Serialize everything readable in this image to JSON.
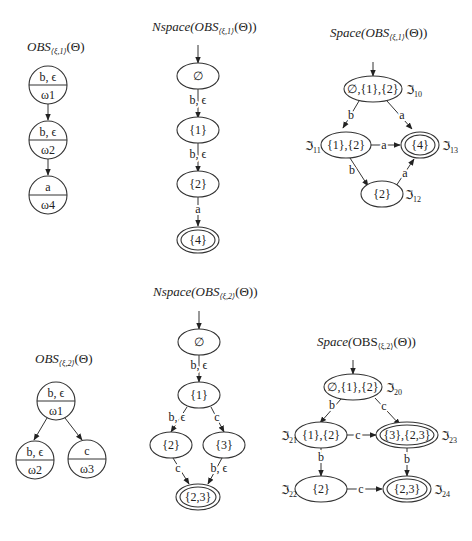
{
  "panels": [
    {
      "id": "obs1",
      "title": {
        "name": "OBS",
        "subscript": "⟨ξ,1⟩",
        "suffix": "(Θ)"
      },
      "nodes": [
        {
          "top": "b, ϵ",
          "bottom": "ω1"
        },
        {
          "top": "b, ϵ",
          "bottom": "ω2"
        },
        {
          "top": "a",
          "bottom": "ω4"
        }
      ]
    },
    {
      "id": "nspace1",
      "title": {
        "prefix": "Nspace(",
        "name": "OBS",
        "subscript": "⟨ξ,1⟩",
        "suffix": "(Θ))"
      },
      "nodes": [
        "∅",
        "{1}",
        "{2}",
        "{4}"
      ],
      "edges": [
        {
          "from": "∅",
          "to": "{1}",
          "label": "b, ϵ"
        },
        {
          "from": "{1}",
          "to": "{2}",
          "label": "b, ϵ"
        },
        {
          "from": "{2}",
          "to": "{4}",
          "label": "a"
        }
      ],
      "final": [
        "{4}"
      ]
    },
    {
      "id": "space1",
      "title": {
        "prefix": "Space(",
        "name": "OBS",
        "subscript": "⟨ξ,1⟩",
        "suffix": "(Θ))"
      },
      "nodes": [
        {
          "label": "∅,{1},{2}",
          "state": "ℑ",
          "sub": "10"
        },
        {
          "label": "{1},{2}",
          "state": "ℑ",
          "sub": "11"
        },
        {
          "label": "{4}",
          "state": "ℑ",
          "sub": "13"
        },
        {
          "label": "{2}",
          "state": "ℑ",
          "sub": "12"
        }
      ],
      "edges": [
        {
          "from": "∅,{1},{2}",
          "to": "{1},{2}",
          "label": "b"
        },
        {
          "from": "∅,{1},{2}",
          "to": "{4}",
          "label": "a"
        },
        {
          "from": "{1},{2}",
          "to": "{4}",
          "label": "a"
        },
        {
          "from": "{1},{2}",
          "to": "{2}",
          "label": "b"
        },
        {
          "from": "{2}",
          "to": "{4}",
          "label": "a"
        }
      ],
      "final": [
        "{4}"
      ]
    },
    {
      "id": "obs2",
      "title": {
        "name": "OBS",
        "subscript": "⟨ξ,2⟩",
        "suffix": "(Θ)"
      },
      "nodes": [
        {
          "top": "b, ϵ",
          "bottom": "ω1"
        },
        {
          "top": "b, ϵ",
          "bottom": "ω2"
        },
        {
          "top": "c",
          "bottom": "ω3"
        }
      ]
    },
    {
      "id": "nspace2",
      "title": {
        "prefix": "Nspace(",
        "name": "OBS",
        "subscript": "⟨ξ,2⟩",
        "suffix": "(Θ))"
      },
      "nodes": [
        "∅",
        "{1}",
        "{2}",
        "{3}",
        "{2,3}"
      ],
      "edges": [
        {
          "from": "∅",
          "to": "{1}",
          "label": "b, ϵ"
        },
        {
          "from": "{1}",
          "to": "{2}",
          "label": "b, ϵ"
        },
        {
          "from": "{1}",
          "to": "{3}",
          "label": "c"
        },
        {
          "from": "{2}",
          "to": "{2,3}",
          "label": "c"
        },
        {
          "from": "{3}",
          "to": "{2,3}",
          "label": "b, ϵ"
        }
      ],
      "final": [
        "{2,3}"
      ]
    },
    {
      "id": "space2",
      "title": {
        "prefix": "Space(",
        "name": "OBS",
        "subscript": "⟨ξ,2⟩",
        "suffix": "(Θ))"
      },
      "nodes": [
        {
          "label": "∅,{1},{2}",
          "state": "ℑ",
          "sub": "20"
        },
        {
          "label": "{1},{2}",
          "state": "ℑ",
          "sub": "21"
        },
        {
          "label": "{3},{2,3}",
          "state": "ℑ",
          "sub": "23"
        },
        {
          "label": "{2}",
          "state": "ℑ",
          "sub": "22"
        },
        {
          "label": "{2,3}",
          "state": "ℑ",
          "sub": "24"
        }
      ],
      "edges": [
        {
          "from": "∅,{1},{2}",
          "to": "{1},{2}",
          "label": "b"
        },
        {
          "from": "∅,{1},{2}",
          "to": "{3},{2,3}",
          "label": "c"
        },
        {
          "from": "{1},{2}",
          "to": "{3},{2,3}",
          "label": "c"
        },
        {
          "from": "{1},{2}",
          "to": "{2}",
          "label": "b"
        },
        {
          "from": "{3},{2,3}",
          "to": "{2,3}",
          "label": "b"
        },
        {
          "from": "{2}",
          "to": "{2,3}",
          "label": "c"
        }
      ],
      "final": [
        "{3},{2,3}",
        "{2,3}"
      ]
    }
  ]
}
